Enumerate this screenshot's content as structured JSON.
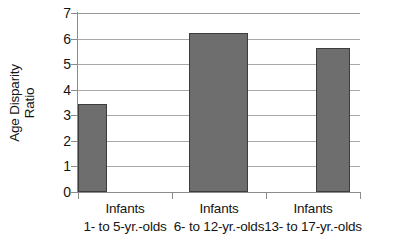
{
  "chart_data": {
    "type": "bar",
    "title": "",
    "xlabel": "",
    "ylabel": "Age Disparity Ratio",
    "ylabel_lines": [
      "Age Disparity",
      "Ratio"
    ],
    "categories": [
      "Infants\n1- to 5-yr.-olds",
      "Infants\n6- to 12-yr.-olds",
      "Infants\n13- to 17-yr.-olds"
    ],
    "category_lines": [
      {
        "line1": "Infants",
        "line2": "1- to 5-yr.-olds"
      },
      {
        "line1": "Infants",
        "line2": "6- to 12-yr.-olds"
      },
      {
        "line1": "Infants",
        "line2": "13- to 17-yr.-olds"
      }
    ],
    "values": [
      3.45,
      6.22,
      5.63
    ],
    "ylim": [
      0,
      7
    ],
    "ytick_values": [
      0,
      1,
      2,
      3,
      4,
      5,
      6,
      7
    ],
    "ytick_labels": [
      "0",
      "1",
      "2",
      "3",
      "4",
      "5",
      "6",
      "7"
    ],
    "grid": true,
    "grid_axis": "y",
    "legend": false,
    "legend_position": "none",
    "bar_color": "#6e6e6e",
    "bar_border_color": "#3d3d3d",
    "gridline_color": "#a8a8a8",
    "axis_color": "#8c8c8c",
    "background_color": "#ffffff",
    "text_color": "#141414"
  }
}
